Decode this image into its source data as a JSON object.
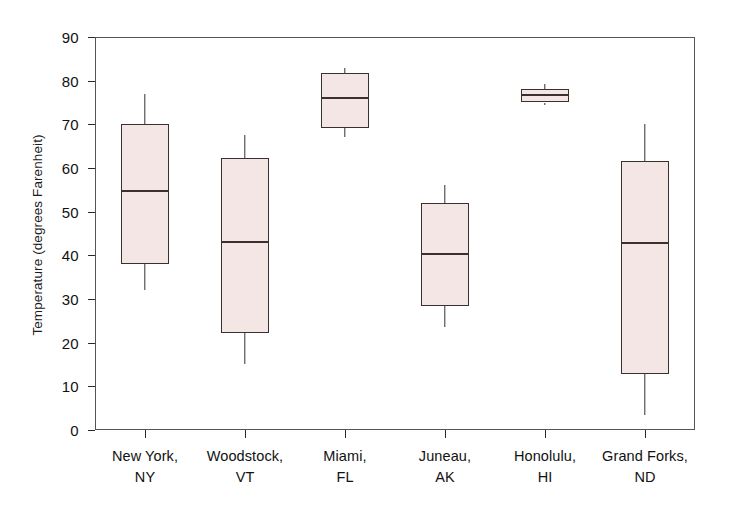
{
  "chart_data": {
    "type": "box",
    "title": "",
    "xlabel": "",
    "ylabel": "Temperature (degrees Farenheit)",
    "ylim": [
      0,
      90
    ],
    "ytick_labels": [
      "90",
      "80",
      "70",
      "60",
      "50",
      "40",
      "30",
      "20",
      "10",
      "0"
    ],
    "ytick_values": [
      90,
      80,
      70,
      60,
      50,
      40,
      30,
      20,
      10,
      0
    ],
    "grid": false,
    "legend": "none",
    "categories": [
      {
        "line1": "New York,",
        "line2": "NY"
      },
      {
        "line1": "Woodstock,",
        "line2": "VT"
      },
      {
        "line1": "Miami,",
        "line2": "FL"
      },
      {
        "line1": "Juneau,",
        "line2": "AK"
      },
      {
        "line1": "Honolulu,",
        "line2": "HI"
      },
      {
        "line1": "Grand Forks,",
        "line2": "ND"
      }
    ],
    "boxes": [
      {
        "name": "New York, NY",
        "whisker_low": 32.0,
        "q1": 38.0,
        "median": 55.0,
        "q3": 70.0,
        "whisker_high": 77.0
      },
      {
        "name": "Woodstock, VT",
        "whisker_low": 15.0,
        "q1": 22.3,
        "median": 43.3,
        "q3": 62.2,
        "whisker_high": 67.5
      },
      {
        "name": "Miami, FL",
        "whisker_low": 67.0,
        "q1": 69.2,
        "median": 76.2,
        "q3": 81.8,
        "whisker_high": 83.0
      },
      {
        "name": "Juneau, AK",
        "whisker_low": 23.5,
        "q1": 28.5,
        "median": 40.5,
        "q3": 52.0,
        "whisker_high": 56.0
      },
      {
        "name": "Honolulu, HI",
        "whisker_low": 74.5,
        "q1": 75.0,
        "median": 77.0,
        "q3": 78.2,
        "whisker_high": 79.2
      },
      {
        "name": "Grand Forks, ND",
        "whisker_low": 3.5,
        "q1": 12.8,
        "median": 43.0,
        "q3": 61.6,
        "whisker_high": 70.0
      }
    ],
    "colors": {
      "box_fill": "#f3e6e4",
      "box_border": "#3a3030",
      "axis": "#555555",
      "text": "#111111"
    }
  }
}
